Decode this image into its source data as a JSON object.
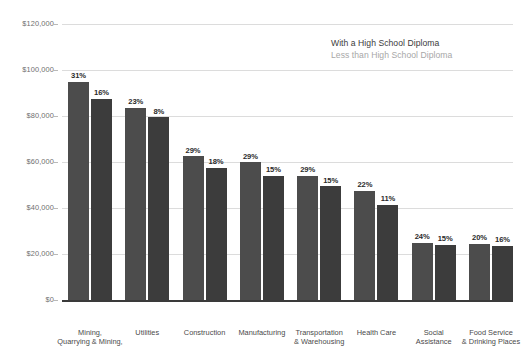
{
  "legend": {
    "series1_label": "With a High School Diploma",
    "series2_label": "Less than High School Diploma",
    "series1_color": "#4c4c4c",
    "series2_color": "#3c3c3c",
    "series1_text_color": "#3b3b3b",
    "series2_text_color": "#a7a7a7",
    "position": "top-right"
  },
  "axis": {
    "y_ticks": [
      "$120,000",
      "$100,000",
      "$80,000",
      "$60,000",
      "$40,000",
      "$20,000",
      "$0"
    ],
    "y_tick_values": [
      120000,
      100000,
      80000,
      60000,
      40000,
      20000,
      0
    ],
    "grid": true,
    "y_label": "",
    "x_label": ""
  },
  "chart_data": {
    "type": "bar",
    "title": "",
    "subtitle": "",
    "xlabel": "",
    "ylabel": "",
    "ylim": [
      0,
      120000
    ],
    "ytick_step": 20000,
    "grid": true,
    "legend_position": "top-right",
    "categories": [
      "Mining,\nQuarrying & Mining,\nand Oil Extraction",
      "Utilities",
      "Construction",
      "Manufacturing",
      "Transportation\n& Warehousing",
      "Health Care",
      "Social\nAssistance",
      "Food Service\n& Drinking Places"
    ],
    "series": [
      {
        "name": "With a High School Diploma",
        "color": "#4c4c4c",
        "values": [
          95000,
          83500,
          62500,
          60000,
          54000,
          47500,
          25000,
          24500
        ],
        "data_labels": [
          "31%",
          "23%",
          "29%",
          "29%",
          "29%",
          "22%",
          "24%",
          "20%"
        ]
      },
      {
        "name": "Less than High School Diploma",
        "color": "#3c3c3c",
        "values": [
          87500,
          79500,
          57500,
          54000,
          49500,
          41500,
          24000,
          23500
        ],
        "data_labels": [
          "16%",
          "8%",
          "18%",
          "15%",
          "15%",
          "11%",
          "15%",
          "16%"
        ]
      }
    ]
  }
}
